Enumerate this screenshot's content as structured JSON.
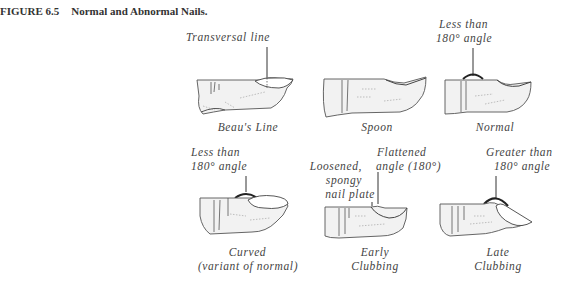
{
  "figure": {
    "number": "FIGURE 6.5",
    "title": "Normal and Abnormal Nails."
  },
  "panels": [
    {
      "id": "beaus-line",
      "caption": "Beau's Line",
      "annotation": [
        "Transversal line"
      ]
    },
    {
      "id": "spoon",
      "caption": "Spoon",
      "annotation": []
    },
    {
      "id": "normal",
      "caption": "Normal",
      "annotation": [
        "Less than",
        "180° angle"
      ]
    },
    {
      "id": "curved",
      "caption": [
        "Curved",
        "(variant of normal)"
      ],
      "annotation": [
        "Less than",
        "180° angle"
      ]
    },
    {
      "id": "early-clubbing",
      "caption": [
        "Early",
        "Clubbing"
      ],
      "annotation_left": [
        "Loosened,",
        "spongy",
        "nail plate"
      ],
      "annotation_right": [
        "Flattened",
        "angle (180°)"
      ]
    },
    {
      "id": "late-clubbing",
      "caption": [
        "Late",
        "Clubbing"
      ],
      "annotation": [
        "Greater than",
        "180° angle"
      ]
    }
  ]
}
